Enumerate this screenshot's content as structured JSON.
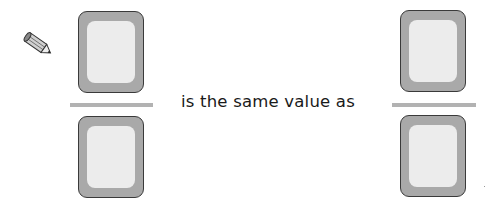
{
  "instruction_icon": "pencil-icon",
  "left_fraction": {
    "numerator": "",
    "denominator": ""
  },
  "right_fraction": {
    "numerator": "",
    "denominator": ""
  },
  "phrase": "is the same value as",
  "colors": {
    "box_fill": "#a9a9a9",
    "box_inner": "#ececec",
    "box_border": "#3a3a3a",
    "fraction_bar": "#b2b2b2",
    "text": "#1a1a1a"
  }
}
